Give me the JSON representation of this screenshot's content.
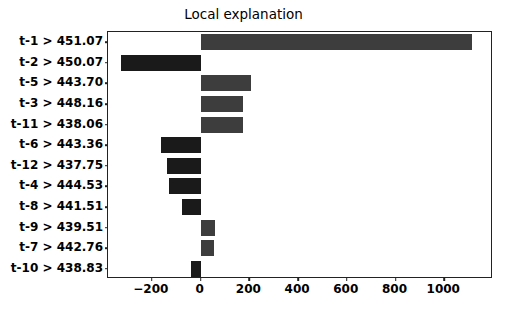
{
  "chart_data": {
    "type": "bar",
    "orientation": "horizontal",
    "title": "Local explanation",
    "xlabel": "",
    "ylabel": "",
    "grid": false,
    "legend": null,
    "xlim": [
      -380,
      1200
    ],
    "xticks": [
      -200,
      0,
      200,
      400,
      600,
      800,
      1000
    ],
    "xtick_labels": [
      "−200",
      "0",
      "200",
      "400",
      "600",
      "800",
      "1000"
    ],
    "categories": [
      "t-1 > 451.07",
      "t-2 > 450.07",
      "t-5 > 443.70",
      "t-3 > 448.16",
      "t-11 > 438.06",
      "t-6 > 443.36",
      "t-12 > 437.75",
      "t-4 > 444.53",
      "t-8 > 441.51",
      "t-9 > 439.51",
      "t-7 > 442.76",
      "t-10 > 438.83"
    ],
    "values": [
      1115,
      -328,
      205,
      176,
      172,
      -164,
      -139,
      -131,
      -78,
      61,
      57,
      -39
    ],
    "colors": {
      "positive": "#3d3d3d",
      "negative": "#1a1a1a",
      "axis": "#222222",
      "text": "#000000",
      "background": "#ffffff"
    }
  }
}
